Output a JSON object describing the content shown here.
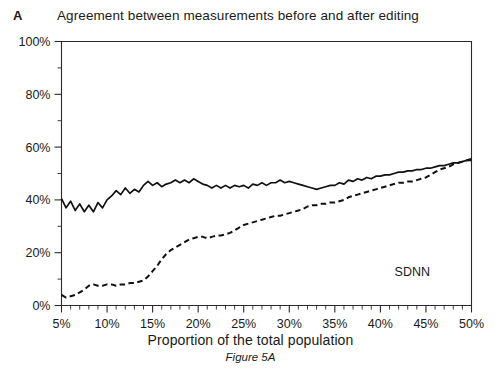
{
  "figure": {
    "panel_label": "A",
    "title": "Agreement between measurements before and after editing",
    "caption": "Figure 5A"
  },
  "chart_data": {
    "type": "line",
    "title": "Agreement between measurements before and after editing",
    "xlabel": "Proportion of the total population",
    "ylabel": "",
    "xlim": [
      5,
      50
    ],
    "ylim": [
      0,
      100
    ],
    "grid": false,
    "legend_position": "none",
    "annotations": [
      {
        "text": "SDNN",
        "x": 43.5,
        "y": 11
      }
    ],
    "xticks": [
      5,
      10,
      15,
      20,
      25,
      30,
      35,
      40,
      45,
      50
    ],
    "xticklabels": [
      "5%",
      "10%",
      "15%",
      "20%",
      "25%",
      "30%",
      "35%",
      "40%",
      "45%",
      "50%"
    ],
    "xminortick_step": 1,
    "yticks": [
      0,
      20,
      40,
      60,
      80,
      100
    ],
    "yticklabels": [
      "0%",
      "20%",
      "40%",
      "60%",
      "80%",
      "100%"
    ],
    "yminortick_step": 10,
    "x": [
      5,
      5.5,
      6,
      6.5,
      7,
      7.5,
      8,
      8.5,
      9,
      9.5,
      10,
      10.5,
      11,
      11.5,
      12,
      12.5,
      13,
      13.5,
      14,
      14.5,
      15,
      15.5,
      16,
      16.5,
      17,
      17.5,
      18,
      18.5,
      19,
      19.5,
      20,
      20.5,
      21,
      21.5,
      22,
      22.5,
      23,
      23.5,
      24,
      24.5,
      25,
      25.5,
      26,
      26.5,
      27,
      27.5,
      28,
      28.5,
      29,
      29.5,
      30,
      30.5,
      31,
      31.5,
      32,
      32.5,
      33,
      33.5,
      34,
      34.5,
      35,
      35.5,
      36,
      36.5,
      37,
      37.5,
      38,
      38.5,
      39,
      39.5,
      40,
      40.5,
      41,
      41.5,
      42,
      42.5,
      43,
      43.5,
      44,
      44.5,
      45,
      45.5,
      46,
      46.5,
      47,
      47.5,
      48,
      48.5,
      49,
      49.5,
      50
    ],
    "series": [
      {
        "name": "Before editing",
        "style": "solid",
        "color": "#111111",
        "values": [
          40.5,
          37.0,
          39.5,
          36.0,
          38.5,
          35.5,
          38.0,
          35.5,
          39.0,
          37.0,
          40.0,
          41.5,
          43.5,
          42.0,
          44.5,
          42.5,
          44.0,
          43.0,
          45.5,
          47.0,
          45.5,
          46.5,
          45.0,
          46.0,
          46.5,
          47.5,
          46.5,
          47.5,
          46.5,
          48.0,
          47.0,
          46.0,
          45.5,
          44.5,
          45.5,
          44.5,
          45.5,
          44.5,
          45.5,
          45.0,
          45.5,
          44.5,
          46.0,
          45.5,
          46.5,
          45.5,
          46.5,
          46.5,
          47.5,
          46.5,
          47.0,
          46.5,
          46.0,
          45.5,
          45.0,
          44.5,
          44.0,
          44.5,
          45.0,
          45.5,
          45.5,
          46.5,
          46.0,
          47.5,
          47.0,
          48.0,
          47.5,
          48.5,
          48.0,
          49.0,
          49.0,
          49.5,
          49.5,
          50.0,
          50.5,
          50.5,
          51.0,
          51.0,
          51.5,
          51.5,
          52.0,
          52.0,
          52.5,
          53.0,
          53.0,
          53.5,
          54.0,
          54.0,
          54.5,
          55.0,
          55.0
        ]
      },
      {
        "name": "After editing",
        "style": "dashed",
        "color": "#111111",
        "values": [
          4.0,
          3.0,
          3.5,
          4.0,
          5.0,
          6.0,
          7.5,
          8.0,
          7.5,
          7.5,
          8.0,
          8.0,
          7.5,
          8.0,
          8.0,
          8.5,
          8.5,
          9.0,
          9.5,
          11.0,
          13.0,
          15.0,
          17.5,
          19.5,
          21.0,
          22.0,
          23.0,
          24.0,
          25.0,
          25.5,
          26.0,
          26.0,
          25.5,
          26.0,
          26.5,
          26.5,
          27.0,
          27.5,
          28.5,
          29.5,
          30.5,
          31.0,
          31.5,
          32.0,
          32.5,
          33.0,
          33.5,
          34.0,
          34.0,
          34.5,
          35.0,
          35.5,
          36.0,
          36.5,
          37.5,
          38.0,
          38.0,
          38.5,
          38.5,
          39.0,
          39.0,
          39.5,
          40.0,
          41.0,
          41.5,
          42.0,
          42.5,
          43.0,
          43.5,
          44.0,
          44.5,
          45.0,
          45.5,
          46.0,
          46.5,
          46.5,
          47.0,
          47.0,
          47.5,
          48.0,
          48.5,
          49.5,
          50.5,
          51.5,
          52.0,
          52.5,
          53.5,
          54.0,
          54.5,
          55.0,
          55.5
        ]
      }
    ]
  },
  "axes": {
    "x_title": "Proportion of the total population"
  }
}
